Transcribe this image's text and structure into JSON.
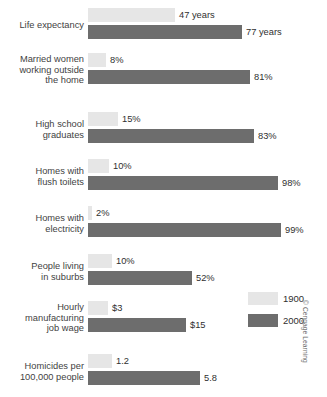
{
  "chart_data": {
    "type": "bar",
    "title": "",
    "xlabel": "",
    "ylabel": "",
    "orientation": "horizontal",
    "grid": false,
    "legend_position": "right",
    "categories": [
      "Life expectancy",
      "Married women working outside the home",
      "High school graduates",
      "Homes with flush toilets",
      "Homes with electricity",
      "People living in suburbs",
      "Hourly manufacturing job wage",
      "Homicides per 100,000 people"
    ],
    "series": [
      {
        "name": "1900",
        "color": "#e6e6e6",
        "values": [
          47,
          8,
          15,
          10,
          2,
          10,
          3,
          1.2
        ],
        "labels": [
          "47 years",
          "8%",
          "15%",
          "10%",
          "2%",
          "10%",
          "$3",
          "1.2"
        ]
      },
      {
        "name": "2000",
        "color": "#6d6d6d",
        "values": [
          77,
          81,
          83,
          98,
          99,
          52,
          15,
          5.8
        ],
        "labels": [
          "77 years",
          "81%",
          "83%",
          "98%",
          "99%",
          "52%",
          "$15",
          "5.8"
        ]
      }
    ]
  },
  "rows": [
    {
      "label_lines": [
        "Life expectancy"
      ],
      "top": 6,
      "first": {
        "value_label": "47 years",
        "bar_px": 87
      },
      "second": {
        "value_label": "77 years",
        "bar_px": 154
      }
    },
    {
      "label_lines": [
        "Married women",
        "working outside",
        "the home"
      ],
      "top": 51,
      "first": {
        "value_label": "8%",
        "bar_px": 18
      },
      "second": {
        "value_label": "81%",
        "bar_px": 162
      }
    },
    {
      "label_lines": [
        "High school",
        "graduates"
      ],
      "top": 110,
      "first": {
        "value_label": "15%",
        "bar_px": 30
      },
      "second": {
        "value_label": "83%",
        "bar_px": 166
      }
    },
    {
      "label_lines": [
        "Homes with",
        "flush toilets"
      ],
      "top": 157,
      "first": {
        "value_label": "10%",
        "bar_px": 21
      },
      "second": {
        "value_label": "98%",
        "bar_px": 190
      }
    },
    {
      "label_lines": [
        "Homes with",
        "electricity"
      ],
      "top": 204,
      "first": {
        "value_label": "2%",
        "bar_px": 4
      },
      "second": {
        "value_label": "99%",
        "bar_px": 193
      }
    },
    {
      "label_lines": [
        "People living",
        "in suburbs"
      ],
      "top": 252,
      "first": {
        "value_label": "10%",
        "bar_px": 24
      },
      "second": {
        "value_label": "52%",
        "bar_px": 104
      }
    },
    {
      "label_lines": [
        "Hourly",
        "manufacturing",
        "job wage"
      ],
      "top": 299,
      "first": {
        "value_label": "$3",
        "bar_px": 20
      },
      "second": {
        "value_label": "$15",
        "bar_px": 98
      }
    },
    {
      "label_lines": [
        "Homicides per",
        "100,000 people"
      ],
      "top": 352,
      "first": {
        "value_label": "1.2",
        "bar_px": 24
      },
      "second": {
        "value_label": "5.8",
        "bar_px": 112
      }
    }
  ],
  "legend": {
    "items": [
      {
        "label": "1900",
        "color": "#e6e6e6",
        "top": 0
      },
      {
        "label": "2000",
        "color": "#6d6d6d",
        "top": 22
      }
    ]
  },
  "copyright": "© Cengage Learning",
  "colors": {
    "series_1900": "#e6e6e6",
    "series_2000": "#6d6d6d",
    "background": "#ffffff",
    "text": "#3a3a3a"
  }
}
